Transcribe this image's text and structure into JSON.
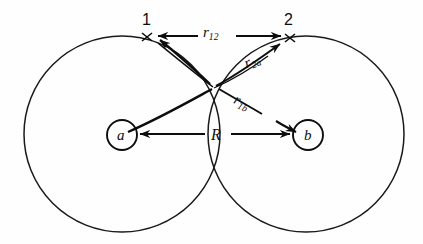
{
  "figure": {
    "kind": "two-center-coordinate-diagram",
    "background_color": "#fefefe",
    "stroke_color": "#0d0d0d",
    "points": {
      "electron_1": {
        "label": "1",
        "x": 147,
        "y": 37,
        "marker": "x"
      },
      "electron_2": {
        "label": "2",
        "x": 290,
        "y": 38,
        "marker": "x"
      },
      "nucleus_a": {
        "label": "a",
        "x": 122,
        "y": 135,
        "circle_radius": 15
      },
      "nucleus_b": {
        "label": "b",
        "x": 308,
        "y": 135,
        "circle_radius": 15
      },
      "crossing": {
        "x": 216,
        "y": 87
      }
    },
    "big_circles": [
      {
        "name": "orbital-a",
        "cx": 122,
        "cy": 134,
        "r": 98
      },
      {
        "name": "orbital-b",
        "cx": 306,
        "cy": 134,
        "r": 98
      }
    ],
    "vectors": [
      {
        "name": "r12",
        "text": "r",
        "sub": "12",
        "from": "electron_1",
        "to": "electron_2",
        "double_headed": true,
        "label_x": 215,
        "label_y": 33,
        "rotation": 0
      },
      {
        "name": "r2a",
        "text": "r",
        "sub": "2a",
        "from": "nucleus_a",
        "to": "electron_2",
        "double_headed": false,
        "label_x": 256,
        "label_y": 66,
        "rotation": -22
      },
      {
        "name": "r1b",
        "text": "r",
        "sub": "1b",
        "from": "electron_1",
        "to": "nucleus_b",
        "double_headed": false,
        "label_x": 251,
        "label_y": 101,
        "rotation": 26
      },
      {
        "name": "R",
        "text": "R",
        "sub": "",
        "from": "nucleus_a",
        "to": "nucleus_b",
        "double_headed": true,
        "label_x": 217,
        "label_y": 135,
        "rotation": 0
      }
    ],
    "labels": {
      "point1": "1",
      "point2": "2",
      "nucleus_a": "a",
      "nucleus_b": "b",
      "r12_base": "r",
      "r12_sub": "12",
      "r2a_base": "r",
      "r2a_sub": "2a",
      "r1b_base": "r",
      "r1b_sub": "1b",
      "internuclear": "R"
    }
  }
}
